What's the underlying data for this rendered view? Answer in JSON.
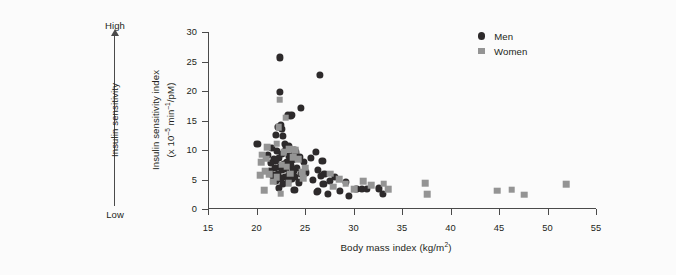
{
  "chart_data": {
    "type": "scatter",
    "title": "",
    "xlabel": "Body mass index (kg/m2)",
    "ylabel": "Insulin sensitivity index (x 10-5 min-1/pM)",
    "xlim": [
      15,
      55
    ],
    "ylim": [
      0,
      30
    ],
    "xticks": [
      15,
      20,
      25,
      30,
      35,
      40,
      45,
      50,
      55
    ],
    "yticks": [
      0,
      5,
      10,
      15,
      20,
      25,
      30
    ],
    "grid": false,
    "legend_position": "top-right",
    "series": [
      {
        "name": "Men",
        "marker": "circle",
        "color": "#2d2a2b",
        "points": [
          [
            22.4,
            25.7
          ],
          [
            26.5,
            22.7
          ],
          [
            22.4,
            19.9
          ],
          [
            24.6,
            17.1
          ],
          [
            23.2,
            16.0
          ],
          [
            23.6,
            15.9
          ],
          [
            22.5,
            14.3
          ],
          [
            22.2,
            13.9
          ],
          [
            22.6,
            13.6
          ],
          [
            23.5,
            15.8
          ],
          [
            22.0,
            12.6
          ],
          [
            22.7,
            12.4
          ],
          [
            20.1,
            11.1
          ],
          [
            22.9,
            11.0
          ],
          [
            23.3,
            10.7
          ],
          [
            21.6,
            10.4
          ],
          [
            23.0,
            10.2
          ],
          [
            23.9,
            10.0
          ],
          [
            22.1,
            9.8
          ],
          [
            24.1,
            9.6
          ],
          [
            22.6,
            9.4
          ],
          [
            21.2,
            9.2
          ],
          [
            23.4,
            9.0
          ],
          [
            24.5,
            8.8
          ],
          [
            22.3,
            8.6
          ],
          [
            21.8,
            8.5
          ],
          [
            23.7,
            8.4
          ],
          [
            22.0,
            8.2
          ],
          [
            24.9,
            8.0
          ],
          [
            23.1,
            7.9
          ],
          [
            21.5,
            7.8
          ],
          [
            22.8,
            7.6
          ],
          [
            26.1,
            9.7
          ],
          [
            25.6,
            8.6
          ],
          [
            26.8,
            8.2
          ],
          [
            23.5,
            7.4
          ],
          [
            22.4,
            7.2
          ],
          [
            21.9,
            7.0
          ],
          [
            24.2,
            6.9
          ],
          [
            23.0,
            6.8
          ],
          [
            22.6,
            6.6
          ],
          [
            21.4,
            6.5
          ],
          [
            23.8,
            6.4
          ],
          [
            25.1,
            6.2
          ],
          [
            22.2,
            6.0
          ],
          [
            24.6,
            5.9
          ],
          [
            23.3,
            5.8
          ],
          [
            21.7,
            5.7
          ],
          [
            22.9,
            5.5
          ],
          [
            24.0,
            5.4
          ],
          [
            22.5,
            5.2
          ],
          [
            23.6,
            5.1
          ],
          [
            26.3,
            6.6
          ],
          [
            27.0,
            6.0
          ],
          [
            26.6,
            5.6
          ],
          [
            25.8,
            5.0
          ],
          [
            22.0,
            4.8
          ],
          [
            23.2,
            4.6
          ],
          [
            24.4,
            4.5
          ],
          [
            22.7,
            4.3
          ],
          [
            26.9,
            4.2
          ],
          [
            28.1,
            5.5
          ],
          [
            27.6,
            4.8
          ],
          [
            29.2,
            4.6
          ],
          [
            22.3,
            3.6
          ],
          [
            23.9,
            3.2
          ],
          [
            28.6,
            3.0
          ],
          [
            30.3,
            3.4
          ],
          [
            30.9,
            3.4
          ],
          [
            31.4,
            3.4
          ],
          [
            32.6,
            3.5
          ],
          [
            26.2,
            2.9
          ],
          [
            27.4,
            2.5
          ],
          [
            29.5,
            2.2
          ],
          [
            33.0,
            2.6
          ],
          [
            26.3,
            3.0
          ]
        ]
      },
      {
        "name": "Women",
        "marker": "square",
        "color": "#949494",
        "points": [
          [
            22.4,
            18.5
          ],
          [
            22.3,
            13.9
          ],
          [
            21.1,
            10.5
          ],
          [
            23.4,
            10.1
          ],
          [
            24.0,
            10.0
          ],
          [
            22.8,
            9.6
          ],
          [
            20.6,
            9.2
          ],
          [
            23.8,
            8.8
          ],
          [
            21.0,
            8.5
          ],
          [
            24.3,
            8.4
          ],
          [
            20.5,
            7.9
          ],
          [
            22.6,
            7.5
          ],
          [
            23.1,
            7.2
          ],
          [
            25.0,
            7.0
          ],
          [
            20.9,
            6.4
          ],
          [
            24.7,
            6.2
          ],
          [
            23.5,
            6.0
          ],
          [
            21.3,
            5.9
          ],
          [
            20.4,
            5.7
          ],
          [
            22.1,
            5.4
          ],
          [
            24.8,
            5.2
          ],
          [
            21.7,
            4.6
          ],
          [
            23.3,
            4.4
          ],
          [
            27.6,
            6.0
          ],
          [
            28.5,
            5.1
          ],
          [
            29.2,
            4.3
          ],
          [
            27.9,
            3.8
          ],
          [
            31.0,
            4.7
          ],
          [
            31.8,
            4.0
          ],
          [
            30.1,
            3.4
          ],
          [
            33.1,
            4.3
          ],
          [
            33.6,
            3.4
          ],
          [
            20.8,
            3.2
          ],
          [
            22.5,
            2.6
          ],
          [
            37.4,
            4.4
          ],
          [
            37.6,
            2.5
          ],
          [
            44.8,
            3.1
          ],
          [
            46.3,
            3.3
          ],
          [
            47.6,
            2.4
          ],
          [
            51.9,
            4.2
          ],
          [
            23.0,
            15.5
          ],
          [
            22.1,
            11.1
          ]
        ]
      }
    ]
  },
  "annotation": {
    "high_label": "High",
    "low_label": "Low",
    "axis_title": "Insulin sensitivity"
  },
  "y_axis": {
    "title_line1": "Insulin sensitivity index",
    "title_line2_pre": "(x 10",
    "title_line2_sup1": "–5",
    "title_line2_mid": " min",
    "title_line2_sup2": "–1",
    "title_line2_post": "/pM)",
    "ticks": [
      "30",
      "25",
      "20",
      "15",
      "10",
      "5",
      "0"
    ]
  },
  "x_axis": {
    "title_pre": "Body mass index (kg/m",
    "title_sup": "2",
    "title_post": ")",
    "ticks": [
      "15",
      "20",
      "25",
      "30",
      "35",
      "40",
      "45",
      "50",
      "55"
    ]
  },
  "legend": {
    "items": [
      {
        "label": "Men",
        "marker": "circle",
        "color": "#2d2a2b"
      },
      {
        "label": "Women",
        "marker": "square",
        "color": "#949494"
      }
    ]
  }
}
